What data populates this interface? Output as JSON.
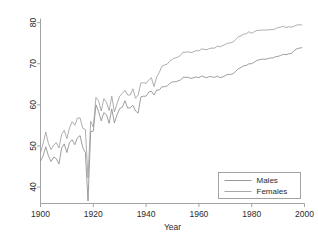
{
  "chart_data": {
    "type": "line",
    "title": "",
    "subtitle": "",
    "xlabel": "Year",
    "ylabel": "",
    "xlim": [
      1900,
      2000
    ],
    "ylim": [
      36,
      81
    ],
    "grid": false,
    "legend_position": "bottom-right",
    "xticks": [
      1900,
      1920,
      1940,
      1960,
      1980,
      2000
    ],
    "xtick_labels": [
      "1900",
      "1920",
      "1940",
      "1960",
      "1980",
      "2000"
    ],
    "yticks": [
      40,
      50,
      60,
      70,
      80
    ],
    "ytick_labels": [
      "40",
      "50",
      "60",
      "70",
      "80"
    ],
    "x": [
      1900,
      1901,
      1902,
      1903,
      1904,
      1905,
      1906,
      1907,
      1908,
      1909,
      1910,
      1911,
      1912,
      1913,
      1914,
      1915,
      1916,
      1917,
      1918,
      1919,
      1920,
      1921,
      1922,
      1923,
      1924,
      1925,
      1926,
      1927,
      1928,
      1929,
      1930,
      1931,
      1932,
      1933,
      1934,
      1935,
      1936,
      1937,
      1938,
      1939,
      1940,
      1941,
      1942,
      1943,
      1944,
      1945,
      1946,
      1947,
      1948,
      1949,
      1950,
      1951,
      1952,
      1953,
      1954,
      1955,
      1956,
      1957,
      1958,
      1959,
      1960,
      1961,
      1962,
      1963,
      1964,
      1965,
      1966,
      1967,
      1968,
      1969,
      1970,
      1971,
      1972,
      1973,
      1974,
      1975,
      1976,
      1977,
      1978,
      1979,
      1980,
      1981,
      1982,
      1983,
      1984,
      1985,
      1986,
      1987,
      1988,
      1989,
      1990,
      1991,
      1992,
      1993,
      1994,
      1995,
      1996,
      1997,
      1998,
      1999
    ],
    "series": [
      {
        "name": "Males",
        "color": "#8c8c8c",
        "values": [
          46.3,
          47.6,
          49.8,
          47.6,
          46.2,
          47.3,
          46.9,
          45.6,
          49.5,
          50.5,
          48.4,
          50.9,
          51.5,
          50.3,
          52.0,
          52.5,
          49.6,
          48.4,
          36.6,
          53.5,
          53.6,
          60.0,
          58.4,
          56.1,
          58.1,
          57.6,
          55.5,
          59.0,
          55.6,
          57.6,
          59.1,
          59.4,
          61.0,
          59.2,
          59.3,
          59.9,
          58.5,
          58.0,
          61.9,
          62.1,
          62.1,
          63.1,
          63.3,
          62.4,
          63.6,
          63.6,
          64.4,
          64.4,
          64.6,
          65.2,
          65.6,
          65.6,
          65.8,
          66.0,
          66.7,
          66.7,
          66.7,
          66.4,
          66.6,
          66.8,
          66.6,
          67.0,
          66.8,
          66.6,
          66.9,
          66.8,
          66.7,
          67.0,
          66.6,
          66.8,
          67.1,
          67.4,
          67.4,
          67.6,
          68.2,
          68.8,
          69.1,
          69.5,
          69.6,
          70.0,
          70.0,
          70.4,
          70.8,
          71.0,
          71.1,
          71.1,
          71.2,
          71.4,
          71.4,
          71.7,
          71.8,
          72.0,
          72.3,
          72.2,
          72.4,
          72.5,
          73.1,
          73.6,
          73.8,
          73.9
        ]
      },
      {
        "name": "Females",
        "color": "#9f9f9f",
        "values": [
          48.3,
          50.6,
          53.4,
          50.6,
          49.1,
          50.2,
          50.8,
          49.5,
          52.8,
          53.8,
          51.8,
          54.4,
          55.9,
          55.0,
          56.8,
          56.8,
          54.3,
          54.0,
          42.2,
          56.0,
          54.6,
          61.8,
          61.0,
          58.5,
          61.5,
          60.6,
          58.6,
          62.1,
          58.3,
          60.3,
          62.1,
          62.8,
          63.5,
          62.4,
          62.4,
          63.9,
          61.6,
          62.4,
          65.3,
          65.4,
          65.2,
          66.0,
          66.6,
          64.4,
          66.8,
          67.9,
          69.4,
          69.7,
          69.9,
          70.7,
          71.1,
          71.4,
          71.6,
          72.0,
          72.8,
          72.8,
          72.9,
          72.7,
          72.9,
          73.2,
          73.1,
          73.6,
          73.5,
          73.4,
          73.7,
          73.8,
          73.8,
          74.3,
          74.1,
          74.4,
          74.7,
          75.0,
          75.1,
          75.3,
          75.9,
          76.6,
          76.8,
          77.2,
          77.3,
          77.8,
          77.4,
          77.8,
          78.1,
          78.1,
          78.2,
          78.2,
          78.2,
          78.3,
          78.3,
          78.5,
          78.8,
          78.9,
          79.1,
          78.8,
          79.0,
          78.9,
          79.1,
          79.4,
          79.5,
          79.4
        ]
      }
    ],
    "legend_entries": [
      {
        "label": "Males",
        "color": "#8c8c8c"
      },
      {
        "label": "Females",
        "color": "#9f9f9f"
      }
    ]
  },
  "axes": {
    "x_title": "Year",
    "y_title": ""
  }
}
